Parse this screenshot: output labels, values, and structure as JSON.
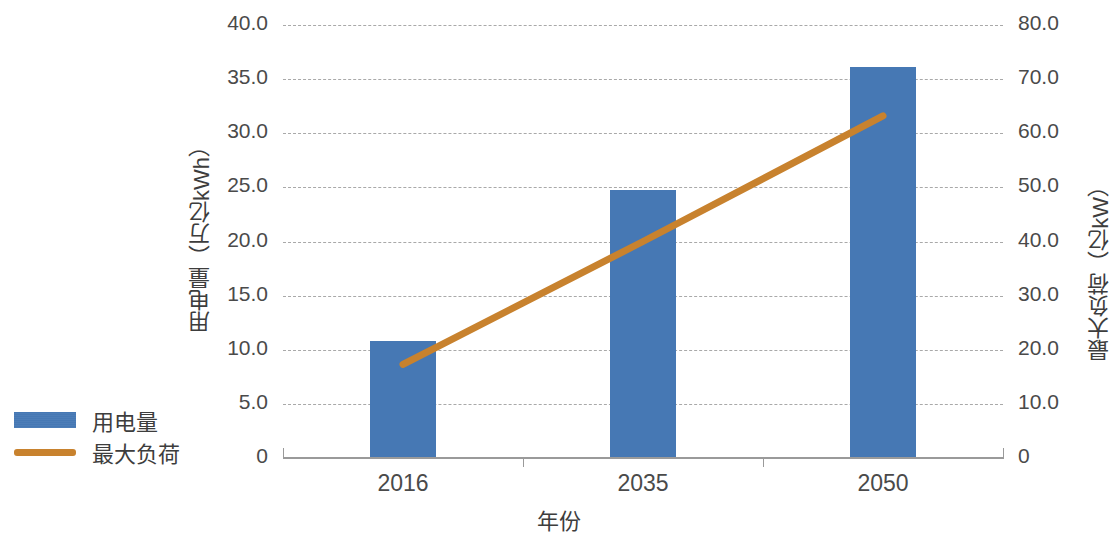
{
  "chart_data": {
    "type": "bar",
    "title": "",
    "categories": [
      "2016",
      "2035",
      "2050"
    ],
    "xlabel": "年份",
    "series": [
      {
        "name": "用电量",
        "type": "bar",
        "axis": "left",
        "unit": "万亿kWh",
        "color": "#4678b4",
        "values": [
          10.8,
          24.8,
          36.1
        ]
      },
      {
        "name": "最大负荷",
        "type": "line",
        "axis": "right",
        "unit": "亿kW",
        "color": "#c8822e",
        "values": [
          17.3,
          40.0,
          63.2
        ]
      }
    ],
    "left_axis": {
      "label": "用电量（万亿kWh）",
      "ylim": [
        0,
        40
      ],
      "ticks": [
        0,
        5,
        10,
        15,
        20,
        25,
        30,
        35,
        40
      ],
      "tick_labels": [
        "0",
        "5.0",
        "10.0",
        "15.0",
        "20.0",
        "25.0",
        "30.0",
        "35.0",
        "40.0"
      ]
    },
    "right_axis": {
      "label": "最大负荷（亿kW）",
      "ylim": [
        0,
        80
      ],
      "ticks": [
        0,
        10,
        20,
        30,
        40,
        50,
        60,
        70,
        80
      ],
      "tick_labels": [
        "0",
        "10.0",
        "20.0",
        "30.0",
        "40.0",
        "50.0",
        "60.0",
        "70.0",
        "80.0"
      ]
    },
    "grid": true,
    "grid_style": "dashed",
    "legend": {
      "position": "left",
      "entries": [
        {
          "label": "用电量",
          "marker": "bar",
          "color": "#4678b4"
        },
        {
          "label": "最大负荷",
          "marker": "line",
          "color": "#c8822e"
        }
      ]
    }
  }
}
